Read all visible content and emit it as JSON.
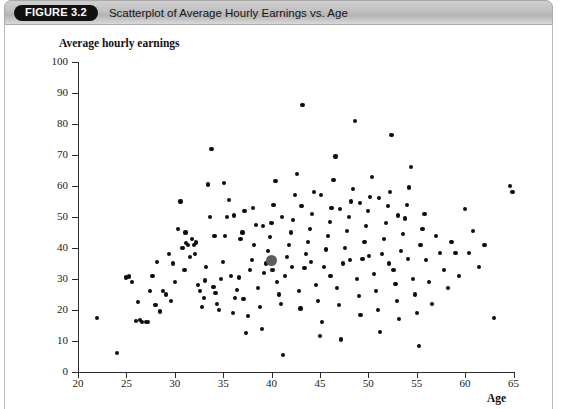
{
  "header": {
    "figure_badge": "FIGURE 3.2",
    "title": "Scatterplot of Average Hourly Earnings vs. Age"
  },
  "chart_data": {
    "type": "scatter",
    "title": "Scatterplot of Average Hourly Earnings vs. Age",
    "xlabel": "Age",
    "ylabel": "Average hourly earnings",
    "xlim": [
      20,
      65
    ],
    "ylim": [
      0,
      100
    ],
    "xticks": [
      20,
      25,
      30,
      35,
      40,
      45,
      50,
      55,
      60,
      65
    ],
    "yticks": [
      0,
      10,
      20,
      30,
      40,
      50,
      60,
      70,
      80,
      90,
      100
    ],
    "grid": false,
    "legend": null,
    "series": [
      {
        "name": "Individuals",
        "marker": "filled-circle",
        "color": "#0d0d0d",
        "points": [
          [
            22.0,
            17.5
          ],
          [
            24.0,
            6.0
          ],
          [
            25.3,
            30.8
          ],
          [
            25.6,
            29.0
          ],
          [
            26.2,
            22.5
          ],
          [
            26.4,
            16.8
          ],
          [
            26.6,
            16.2
          ],
          [
            27.0,
            16.0
          ],
          [
            27.4,
            26.0
          ],
          [
            27.7,
            31.0
          ],
          [
            28.0,
            21.5
          ],
          [
            28.2,
            35.5
          ],
          [
            28.5,
            19.5
          ],
          [
            28.8,
            26.2
          ],
          [
            29.1,
            25.0
          ],
          [
            29.4,
            38.0
          ],
          [
            29.6,
            23.0
          ],
          [
            30.0,
            29.0
          ],
          [
            30.3,
            46.0
          ],
          [
            30.6,
            55.0
          ],
          [
            30.8,
            40.0
          ],
          [
            31.0,
            33.0
          ],
          [
            31.2,
            41.5
          ],
          [
            31.4,
            41.0
          ],
          [
            31.6,
            37.0
          ],
          [
            31.8,
            43.0
          ],
          [
            32.0,
            41.0
          ],
          [
            32.2,
            41.8
          ],
          [
            32.4,
            28.0
          ],
          [
            32.6,
            26.0
          ],
          [
            32.8,
            21.0
          ],
          [
            33.0,
            24.0
          ],
          [
            33.2,
            34.0
          ],
          [
            33.4,
            60.5
          ],
          [
            33.6,
            50.0
          ],
          [
            33.8,
            72.0
          ],
          [
            34.0,
            27.5
          ],
          [
            34.2,
            25.5
          ],
          [
            34.4,
            22.0
          ],
          [
            34.6,
            20.0
          ],
          [
            34.8,
            30.0
          ],
          [
            35.0,
            35.5
          ],
          [
            35.2,
            44.0
          ],
          [
            35.4,
            50.0
          ],
          [
            35.6,
            55.5
          ],
          [
            35.8,
            31.0
          ],
          [
            36.0,
            19.0
          ],
          [
            36.2,
            24.0
          ],
          [
            36.4,
            26.5
          ],
          [
            36.6,
            30.5
          ],
          [
            36.8,
            43.0
          ],
          [
            37.0,
            45.0
          ],
          [
            37.2,
            52.0
          ],
          [
            37.4,
            12.5
          ],
          [
            37.6,
            18.0
          ],
          [
            37.8,
            33.0
          ],
          [
            38.0,
            36.0
          ],
          [
            38.2,
            41.0
          ],
          [
            38.4,
            47.5
          ],
          [
            38.6,
            27.0
          ],
          [
            38.8,
            21.0
          ],
          [
            39.0,
            14.0
          ],
          [
            39.2,
            32.0
          ],
          [
            39.4,
            35.0
          ],
          [
            39.6,
            39.0
          ],
          [
            39.8,
            43.5
          ],
          [
            40.0,
            48.0
          ],
          [
            40.2,
            54.0
          ],
          [
            40.4,
            61.5
          ],
          [
            40.6,
            29.0
          ],
          [
            40.8,
            25.0
          ],
          [
            41.0,
            22.0
          ],
          [
            41.2,
            5.5
          ],
          [
            41.4,
            31.0
          ],
          [
            41.6,
            37.0
          ],
          [
            41.8,
            41.0
          ],
          [
            42.0,
            45.0
          ],
          [
            42.2,
            49.0
          ],
          [
            42.4,
            57.0
          ],
          [
            42.6,
            64.0
          ],
          [
            42.8,
            26.0
          ],
          [
            43.0,
            20.5
          ],
          [
            43.2,
            86.0
          ],
          [
            43.4,
            33.5
          ],
          [
            43.6,
            38.0
          ],
          [
            43.8,
            42.0
          ],
          [
            44.0,
            46.0
          ],
          [
            44.2,
            51.0
          ],
          [
            44.4,
            58.0
          ],
          [
            44.6,
            28.0
          ],
          [
            44.8,
            23.0
          ],
          [
            45.0,
            11.5
          ],
          [
            45.2,
            16.0
          ],
          [
            45.4,
            34.0
          ],
          [
            45.6,
            39.5
          ],
          [
            45.8,
            44.0
          ],
          [
            46.0,
            48.5
          ],
          [
            46.2,
            53.0
          ],
          [
            46.4,
            62.0
          ],
          [
            46.6,
            69.5
          ],
          [
            46.8,
            27.0
          ],
          [
            47.0,
            21.5
          ],
          [
            47.2,
            10.5
          ],
          [
            47.4,
            35.0
          ],
          [
            47.6,
            40.0
          ],
          [
            47.8,
            45.5
          ],
          [
            48.0,
            50.0
          ],
          [
            48.2,
            55.0
          ],
          [
            48.4,
            59.0
          ],
          [
            48.6,
            81.0
          ],
          [
            48.8,
            30.0
          ],
          [
            49.0,
            24.5
          ],
          [
            49.2,
            18.5
          ],
          [
            49.4,
            36.5
          ],
          [
            49.6,
            42.0
          ],
          [
            49.8,
            47.0
          ],
          [
            50.0,
            52.0
          ],
          [
            50.2,
            56.5
          ],
          [
            50.4,
            63.0
          ],
          [
            50.6,
            31.5
          ],
          [
            50.8,
            26.0
          ],
          [
            51.0,
            20.0
          ],
          [
            51.2,
            13.0
          ],
          [
            51.4,
            38.0
          ],
          [
            51.6,
            43.0
          ],
          [
            51.8,
            48.0
          ],
          [
            52.0,
            53.5
          ],
          [
            52.2,
            58.0
          ],
          [
            52.4,
            76.5
          ],
          [
            52.6,
            33.0
          ],
          [
            52.8,
            28.5
          ],
          [
            53.0,
            23.0
          ],
          [
            53.2,
            17.0
          ],
          [
            53.4,
            39.0
          ],
          [
            53.6,
            44.5
          ],
          [
            53.8,
            49.5
          ],
          [
            54.0,
            54.0
          ],
          [
            54.2,
            59.5
          ],
          [
            54.4,
            66.0
          ],
          [
            54.6,
            30.0
          ],
          [
            54.8,
            25.0
          ],
          [
            55.0,
            19.0
          ],
          [
            55.2,
            8.5
          ],
          [
            55.4,
            41.0
          ],
          [
            55.6,
            46.0
          ],
          [
            55.8,
            51.0
          ],
          [
            56.0,
            36.0
          ],
          [
            56.3,
            29.0
          ],
          [
            56.6,
            22.0
          ],
          [
            57.0,
            44.0
          ],
          [
            57.4,
            38.5
          ],
          [
            57.8,
            33.0
          ],
          [
            58.2,
            27.0
          ],
          [
            58.6,
            42.0
          ],
          [
            59.0,
            38.5
          ],
          [
            59.4,
            31.0
          ],
          [
            60.0,
            52.5
          ],
          [
            60.4,
            38.5
          ],
          [
            60.8,
            45.5
          ],
          [
            61.4,
            34.0
          ],
          [
            62.0,
            41.0
          ],
          [
            63.0,
            17.5
          ],
          [
            64.6,
            60.0
          ],
          [
            64.9,
            58.0
          ],
          [
            25.0,
            30.5
          ],
          [
            26.0,
            16.5
          ],
          [
            27.2,
            16.0
          ],
          [
            29.8,
            35.0
          ],
          [
            31.1,
            45.0
          ],
          [
            32.1,
            38.0
          ],
          [
            33.1,
            29.5
          ],
          [
            34.1,
            44.0
          ],
          [
            35.1,
            61.0
          ],
          [
            36.1,
            50.5
          ],
          [
            37.1,
            23.5
          ],
          [
            38.1,
            53.0
          ],
          [
            39.1,
            47.0
          ],
          [
            40.1,
            33.0
          ],
          [
            41.1,
            50.0
          ],
          [
            42.1,
            34.0
          ],
          [
            43.1,
            53.5
          ],
          [
            44.1,
            35.5
          ],
          [
            45.1,
            57.0
          ],
          [
            46.1,
            31.0
          ],
          [
            47.1,
            52.5
          ],
          [
            48.1,
            36.0
          ],
          [
            49.1,
            54.5
          ],
          [
            50.1,
            37.5
          ],
          [
            51.1,
            56.0
          ],
          [
            52.1,
            35.0
          ],
          [
            53.1,
            50.5
          ],
          [
            54.1,
            36.5
          ]
        ]
      },
      {
        "name": "Sample mean",
        "marker": "large-gray-circle",
        "color": "#5e5e5e",
        "points": [
          [
            40.0,
            36.0
          ]
        ]
      }
    ]
  }
}
